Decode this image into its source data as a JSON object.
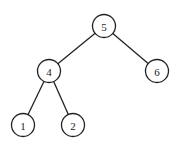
{
  "diagram": {
    "type": "binary-tree",
    "nodes": [
      {
        "id": "n5",
        "label": "5",
        "x": 104,
        "y": 26
      },
      {
        "id": "n4",
        "label": "4",
        "x": 49,
        "y": 71
      },
      {
        "id": "n6",
        "label": "6",
        "x": 157,
        "y": 71
      },
      {
        "id": "n1",
        "label": "1",
        "x": 23,
        "y": 125
      },
      {
        "id": "n2",
        "label": "2",
        "x": 73,
        "y": 125
      }
    ],
    "edges": [
      {
        "from": "n5",
        "to": "n4"
      },
      {
        "from": "n5",
        "to": "n6"
      },
      {
        "from": "n4",
        "to": "n1"
      },
      {
        "from": "n4",
        "to": "n2"
      }
    ],
    "node_radius": 11.5,
    "colors": {
      "stroke": "#222222",
      "fill": "#ffffff",
      "background": "#ffffff"
    }
  }
}
